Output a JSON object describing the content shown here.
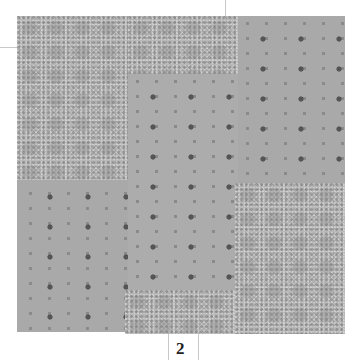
{
  "figure": {
    "caption_number": "2",
    "colors": {
      "floral": "#b9b9b9",
      "dotted": "#a9a9a9",
      "dot_dark": "#555555",
      "guide_lines": "#c8c8c8"
    },
    "patches": [
      {
        "name": "top-left-floral",
        "fabric": "floral"
      },
      {
        "name": "top-center-floral",
        "fabric": "floral"
      },
      {
        "name": "top-right-dotted",
        "fabric": "dotted"
      },
      {
        "name": "center-dotted",
        "fabric": "dotted"
      },
      {
        "name": "bottom-left-dotted",
        "fabric": "dotted"
      },
      {
        "name": "bottom-center-floral",
        "fabric": "floral"
      },
      {
        "name": "bottom-right-floral",
        "fabric": "floral"
      }
    ]
  }
}
